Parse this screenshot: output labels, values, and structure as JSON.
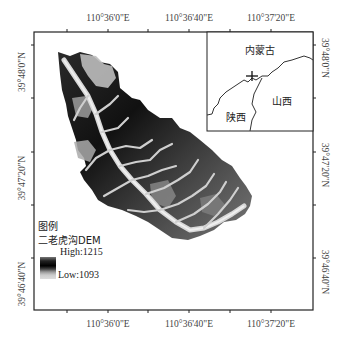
{
  "map": {
    "layer_name": "二老虎沟DEM",
    "legend": {
      "title": "图例",
      "layer": "二老虎沟DEM",
      "high_label": "High:1215",
      "low_label": "Low:1093",
      "high_value": 1215,
      "low_value": 1093,
      "ramp": "black-to-white"
    },
    "axes": {
      "top": [
        "110°36'0\"E",
        "110°36'40\"E",
        "110°37'20\"E"
      ],
      "bottom": [
        "110°36'0\"E",
        "110°36'40\"E",
        "110°37'20\"E"
      ],
      "left": [
        "39°48'0\"N",
        "39°47'20\"N",
        "39°46'40\"N"
      ],
      "right": [
        "39°48'0\"N",
        "39°47'20\"N",
        "39°46'40\"N"
      ]
    },
    "inset": {
      "labels": {
        "north": "内蒙古",
        "east": "山西",
        "southwest": "陕西"
      },
      "marker": "site-cross"
    },
    "colors": {
      "frame": "#222222",
      "background": "#ffffff",
      "dem_high": "#000000",
      "dem_low": "#e0e0e0"
    }
  }
}
